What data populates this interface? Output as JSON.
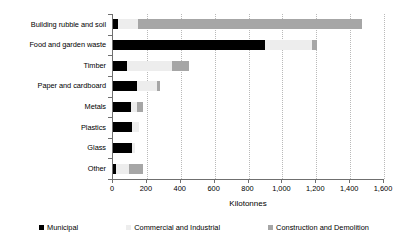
{
  "chart_data": {
    "type": "bar",
    "orientation": "horizontal",
    "stacked": true,
    "title": "",
    "xlabel": "Kilotonnes",
    "ylabel": "",
    "xlim": [
      0,
      1600
    ],
    "xticks": [
      "0",
      "200",
      "400",
      "600",
      "800",
      "1,000",
      "1,200",
      "1,400",
      "1,600"
    ],
    "xtick_values": [
      0,
      200,
      400,
      600,
      800,
      1000,
      1200,
      1400,
      1600
    ],
    "grid": "vertical-dotted",
    "legend_position": "bottom",
    "categories": [
      "Building rubble and soil",
      "Food and garden waste",
      "Timber",
      "Paper and cardboard",
      "Metals",
      "Plastics",
      "Glass",
      "Other"
    ],
    "series": [
      {
        "name": "Municipal",
        "color": "#000000",
        "values": [
          30,
          900,
          85,
          140,
          105,
          110,
          110,
          20
        ]
      },
      {
        "name": "Commercial and Industrial",
        "color": "#ededed",
        "values": [
          120,
          275,
          265,
          120,
          35,
          45,
          20,
          75
        ]
      },
      {
        "name": "Construction and Demolition",
        "color": "#a6a6a6",
        "values": [
          1320,
          30,
          100,
          15,
          40,
          0,
          0,
          80
        ]
      }
    ],
    "totals": [
      1470,
      1205,
      450,
      275,
      180,
      155,
      130,
      175
    ]
  },
  "legend": {
    "items": [
      {
        "label": "Municipal",
        "swatch": "municipal"
      },
      {
        "label": "Commercial and Industrial",
        "swatch": "commercial"
      },
      {
        "label": "Construction and Demolition",
        "swatch": "construction"
      }
    ]
  }
}
